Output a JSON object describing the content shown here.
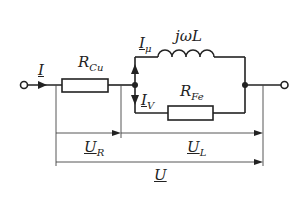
{
  "diagram": {
    "type": "equivalent circuit of iron-core coil",
    "labels": {
      "current_total": "I",
      "resistor_copper": {
        "main": "R",
        "sub": "Cu"
      },
      "current_magnetizing": {
        "main": "I",
        "sub": "μ"
      },
      "inductor": "jωL",
      "current_loss": {
        "main": "I",
        "sub": "V"
      },
      "resistor_iron": {
        "main": "R",
        "sub": "Fe"
      },
      "voltage_resistor": {
        "main": "U",
        "sub": "R"
      },
      "voltage_inductor": {
        "main": "U",
        "sub": "L"
      },
      "voltage_total": "U"
    },
    "colors": {
      "line": "#222222",
      "background": "#ffffff"
    }
  }
}
